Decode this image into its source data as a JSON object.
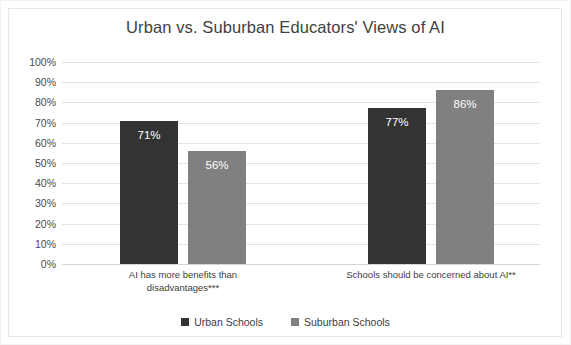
{
  "chart_data": {
    "type": "bar",
    "title": "Urban vs. Suburban Educators' Views of AI",
    "xlabel": "",
    "ylabel": "",
    "ylim": [
      0,
      100
    ],
    "grid": true,
    "legend_position": "bottom",
    "categories": [
      "AI has more benefits than disadvantages***",
      "Schools should be concerned about AI**"
    ],
    "category_lines": [
      [
        "AI has more benefits than",
        "disadvantages***"
      ],
      [
        "Schools should be concerned about AI**"
      ]
    ],
    "series": [
      {
        "name": "Urban Schools",
        "color": "#333333",
        "values": [
          71,
          77
        ],
        "labels": [
          "71%",
          "77%"
        ]
      },
      {
        "name": "Suburban Schools",
        "color": "#808080",
        "values": [
          56,
          86
        ],
        "labels": [
          "56%",
          "86%"
        ]
      }
    ],
    "yticks": [
      100,
      90,
      80,
      70,
      60,
      50,
      40,
      30,
      20,
      10,
      0
    ],
    "ytick_labels": [
      "100%",
      "90%",
      "80%",
      "70%",
      "60%",
      "50%",
      "40%",
      "30%",
      "20%",
      "10%",
      "0%"
    ]
  },
  "colors": {
    "urban": "#333333",
    "suburban": "#808080",
    "gridline": "#e3e3e3",
    "title_text": "#3f3f3f",
    "axis_text": "#4a4a4a",
    "background": "#ffffff",
    "border": "#e8e8e8"
  }
}
